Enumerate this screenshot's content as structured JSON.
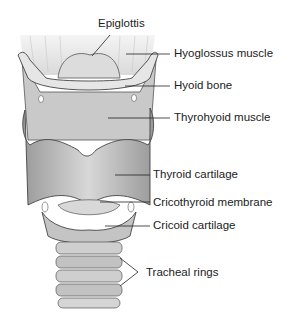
{
  "diagram": {
    "labels": [
      {
        "id": "epiglottis",
        "text": "Epiglottis"
      },
      {
        "id": "hyoglossus",
        "text": "Hyoglossus muscle"
      },
      {
        "id": "hyoid",
        "text": "Hyoid bone"
      },
      {
        "id": "thyrohyoid",
        "text": "Thyrohyoid muscle"
      },
      {
        "id": "thyroid-cartilage",
        "text": "Thyroid cartilage"
      },
      {
        "id": "cricothyroid-membrane",
        "text": "Cricothyroid membrane"
      },
      {
        "id": "cricoid-cartilage",
        "text": "Cricoid cartilage"
      },
      {
        "id": "tracheal-rings",
        "text": "Tracheal rings"
      }
    ],
    "colors": {
      "background": "#ffffff",
      "tissue_light": "#e4e4e4",
      "tissue_mid": "#bdbdbd",
      "tissue_dark": "#8a8a8a",
      "outline": "#444444",
      "text": "#222222"
    }
  }
}
